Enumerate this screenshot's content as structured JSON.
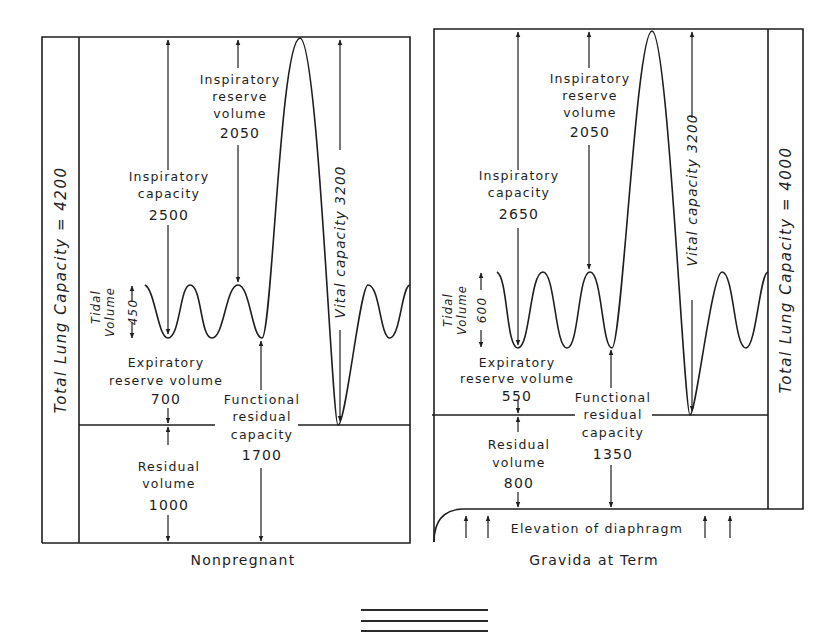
{
  "nonpregnant": {
    "caption": "Nonpregnant",
    "total_lung_capacity": "Total Lung Capacity = 4200",
    "inspiratory_reserve": {
      "line1": "Inspiratory",
      "line2": "reserve",
      "line3": "volume",
      "value": "2050"
    },
    "inspiratory_capacity": {
      "line1": "Inspiratory",
      "line2": "capacity",
      "value": "2500"
    },
    "vital_capacity": "Vital capacity 3200",
    "tidal_volume": {
      "line1": "Tidal",
      "line2": "Volume",
      "value": "450"
    },
    "expiratory_reserve": {
      "line1": "Expiratory",
      "line2": "reserve volume",
      "value": "700"
    },
    "functional_residual": {
      "line1": "Functional",
      "line2": "residual",
      "line3": "capacity",
      "value": "1700"
    },
    "residual_volume": {
      "line1": "Residual",
      "line2": "volume",
      "value": "1000"
    }
  },
  "gravida": {
    "caption": "Gravida at Term",
    "total_lung_capacity": "Total Lung Capacity = 4000",
    "inspiratory_reserve": {
      "line1": "Inspiratory",
      "line2": "reserve",
      "line3": "volume",
      "value": "2050"
    },
    "inspiratory_capacity": {
      "line1": "Inspiratory",
      "line2": "capacity",
      "value": "2650"
    },
    "vital_capacity": "Vital capacity 3200",
    "tidal_volume": {
      "line1": "Tidal",
      "line2": "Volume",
      "value": "600"
    },
    "expiratory_reserve": {
      "line1": "Expiratory",
      "line2": "reserve volume",
      "value": "550"
    },
    "functional_residual": {
      "line1": "Functional",
      "line2": "residual",
      "line3": "capacity",
      "value": "1350"
    },
    "residual_volume": {
      "line1": "Residual",
      "line2": "volume",
      "value": "800"
    },
    "diaphragm_note": "Elevation of diaphragm"
  }
}
